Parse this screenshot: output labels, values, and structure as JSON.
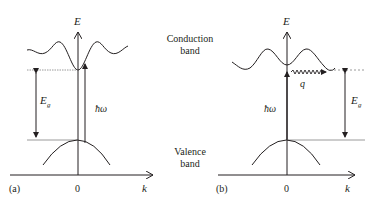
{
  "figure": {
    "panel_a": {
      "label": "(a)",
      "axis_e": "E",
      "axis_k": "k",
      "origin": "0",
      "gap_label": "E",
      "gap_sub": "g",
      "photon_label": "ħω"
    },
    "panel_b": {
      "label": "(b)",
      "axis_e": "E",
      "axis_k": "k",
      "origin": "0",
      "gap_label": "E",
      "gap_sub": "g",
      "photon_label": "ħω",
      "phonon_label": "q"
    },
    "center_labels": {
      "conduction_line1": "Conduction",
      "conduction_line2": "band",
      "valence_line1": "Valence",
      "valence_line2": "band"
    },
    "colors": {
      "line": "#231f20",
      "dashed": "#808080",
      "background": "#ffffff"
    }
  }
}
